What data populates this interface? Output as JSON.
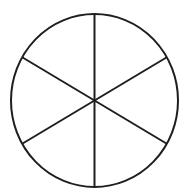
{
  "figure": {
    "background_color": "#ffffff",
    "stroke_color": "#1e1e1e",
    "stroke_width": 2,
    "canvas": {
      "width": 188,
      "height": 194
    },
    "circle": {
      "cx": 94.5,
      "cy": 100.5,
      "rx": 83.5,
      "ry": 86.5
    },
    "num_sectors": 6,
    "sector_angle_deg": 60,
    "diameter_angles_deg": [
      90,
      30,
      150
    ]
  }
}
